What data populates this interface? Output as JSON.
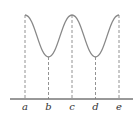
{
  "diagram": {
    "type": "periodic-curve",
    "curve_color": "#888888",
    "axis_color": "#333333",
    "guide_color": "#777777",
    "labels": [
      "a",
      "b",
      "c",
      "d",
      "e"
    ],
    "points": [
      {
        "label": "a",
        "position": "peak"
      },
      {
        "label": "b",
        "position": "trough"
      },
      {
        "label": "c",
        "position": "peak"
      },
      {
        "label": "d",
        "position": "trough"
      },
      {
        "label": "e",
        "position": "peak"
      }
    ]
  }
}
